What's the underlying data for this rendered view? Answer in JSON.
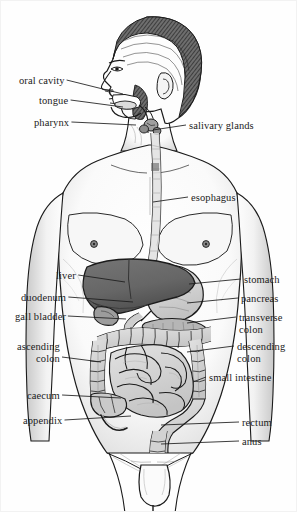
{
  "figure": {
    "style": "black-and-white engraved / line-art anatomical illustration with grayscale shading",
    "background_color": "#fefefe",
    "ink_color": "#1b1b1b",
    "width": 297,
    "height": 512
  },
  "palette": {
    "outline": "#1b1b1b",
    "leader_line": "#1b1b1b",
    "skin_shade": "#e8e8e8",
    "skin_shade_deep": "#cfcfcf",
    "hair_dark": "#3a3a3a",
    "liver": "#6b6b6b",
    "liver_dark": "#555555",
    "stomach": "#d2d2d2",
    "pancreas": "#bdbdbd",
    "colon": "#cccccc",
    "small_intestine": "#d6d6d6",
    "esophagus": "#d8d8d8",
    "paper": "#fefefe"
  },
  "labels": {
    "left": [
      {
        "id": "oral-cavity",
        "text": "oral cavity",
        "x": 18,
        "y": 82,
        "line_to_x": 122,
        "line_to_y": 93,
        "lines": 1
      },
      {
        "id": "tongue",
        "text": "tongue",
        "x": 38,
        "y": 102,
        "line_to_x": 122,
        "line_to_y": 106,
        "lines": 1
      },
      {
        "id": "pharynx",
        "text": "pharynx",
        "x": 33,
        "y": 124,
        "line_to_x": 135,
        "line_to_y": 124,
        "lines": 1
      },
      {
        "id": "liver",
        "text": "liver",
        "x": 55,
        "y": 277,
        "line_to_x": 124,
        "line_to_y": 281,
        "lines": 1
      },
      {
        "id": "duodenum",
        "text": "duodenum",
        "x": 20,
        "y": 299,
        "line_to_x": 132,
        "line_to_y": 301,
        "lines": 1
      },
      {
        "id": "gall-bladder",
        "text": "gall bladder",
        "x": 14,
        "y": 318,
        "line_to_x": 125,
        "line_to_y": 318,
        "lines": 1
      },
      {
        "id": "ascending-colon",
        "text": "ascending\ncolon",
        "x": 16,
        "y": 348,
        "line_to_x": 100,
        "line_to_y": 361,
        "lines": 2
      },
      {
        "id": "caecum",
        "text": "caecum",
        "x": 26,
        "y": 397,
        "line_to_x": 120,
        "line_to_y": 397,
        "lines": 1
      },
      {
        "id": "appendix",
        "text": "appendix",
        "x": 22,
        "y": 422,
        "line_to_x": 130,
        "line_to_y": 415,
        "lines": 1
      }
    ],
    "right": [
      {
        "id": "salivary-glands",
        "text": "salivary glands",
        "x": 188,
        "y": 127,
        "line_to_x": 152,
        "line_to_y": 129,
        "lines": 1
      },
      {
        "id": "esophagus",
        "text": "esophagus",
        "x": 190,
        "y": 199,
        "line_to_x": 152,
        "line_to_y": 201,
        "lines": 1
      },
      {
        "id": "stomach",
        "text": "stomach",
        "x": 243,
        "y": 281,
        "line_to_x": 188,
        "line_to_y": 283,
        "lines": 1
      },
      {
        "id": "pancreas",
        "text": "pancreas",
        "x": 240,
        "y": 300,
        "line_to_x": 186,
        "line_to_y": 302,
        "lines": 1
      },
      {
        "id": "transverse-colon",
        "text": "transverse\ncolon",
        "x": 238,
        "y": 319,
        "line_to_x": 186,
        "line_to_y": 322,
        "lines": 2
      },
      {
        "id": "descending-colon",
        "text": "descending\ncolon",
        "x": 236,
        "y": 348,
        "line_to_x": 186,
        "line_to_y": 351,
        "lines": 2
      },
      {
        "id": "small-intestine",
        "text": "small intestine",
        "x": 208,
        "y": 379,
        "line_to_x": 192,
        "line_to_y": 381,
        "lines": 1
      },
      {
        "id": "rectum",
        "text": "rectum",
        "x": 241,
        "y": 424,
        "line_to_x": 160,
        "line_to_y": 424,
        "lines": 1
      },
      {
        "id": "anus",
        "text": "anus",
        "x": 241,
        "y": 443,
        "line_to_x": 160,
        "line_to_y": 443,
        "lines": 1
      }
    ]
  }
}
